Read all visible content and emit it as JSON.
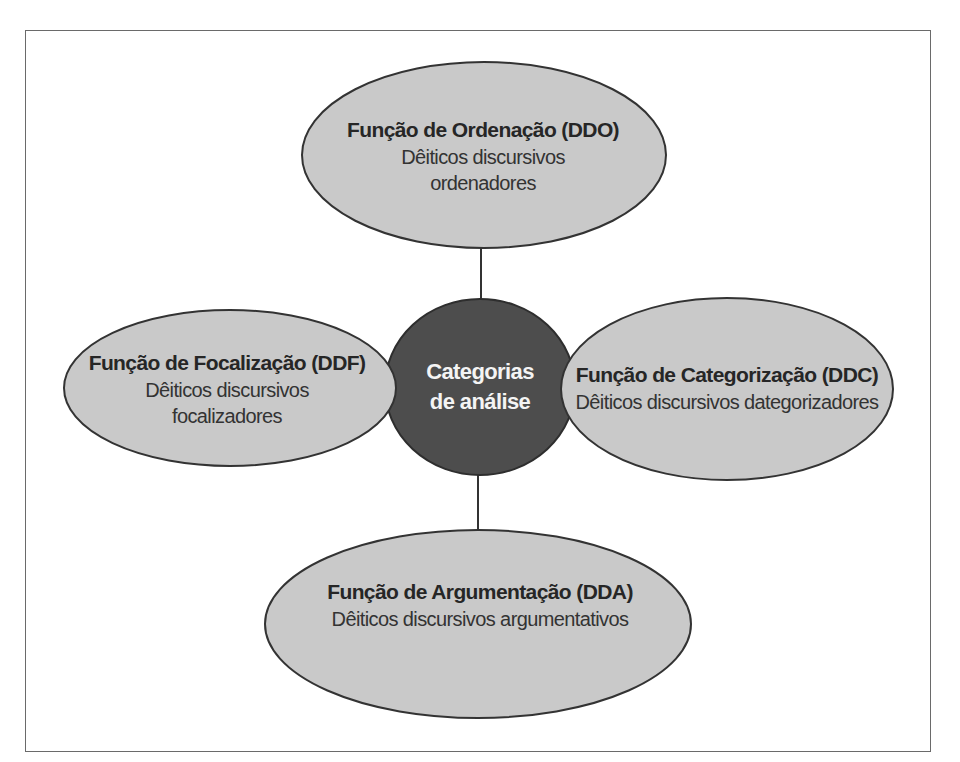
{
  "colors": {
    "node_fill": "#c9c9c9",
    "node_stroke": "#333333",
    "center_fill": "#4d4d4d",
    "center_text": "#f4f4f4",
    "frame_border": "#6a6a6a",
    "connector": "#333333"
  },
  "center": {
    "line1": "Categorias",
    "line2": "de análise"
  },
  "nodes": {
    "top": {
      "title": "Função de Ordenação (DDO)",
      "sub1": "Dêiticos discursivos",
      "sub2": "ordenadores"
    },
    "left": {
      "title": "Função de Focalização (DDF)",
      "sub1": "Dêiticos discursivos",
      "sub2": "focalizadores"
    },
    "right": {
      "title": "Função de Categorização (DDC)",
      "sub1": "Dêiticos discursivos dategorizadores"
    },
    "bottom": {
      "title": "Função de Argumentação (DDA)",
      "sub1": "Dêiticos discursivos argumentativos"
    }
  }
}
